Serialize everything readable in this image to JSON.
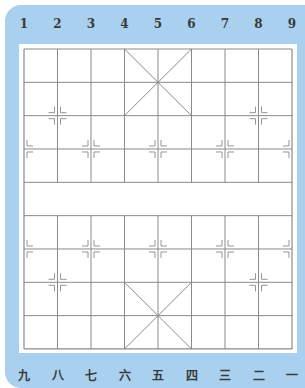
{
  "board": {
    "type": "xiangqi",
    "columns": 9,
    "rows": 10,
    "top_labels": [
      "1",
      "2",
      "3",
      "4",
      "5",
      "6",
      "7",
      "8",
      "9"
    ],
    "bottom_labels": [
      "九",
      "八",
      "七",
      "六",
      "五",
      "四",
      "三",
      "二",
      "一"
    ],
    "markers": [
      {
        "col": 1,
        "row": 2
      },
      {
        "col": 7,
        "row": 2
      },
      {
        "col": 0,
        "row": 3
      },
      {
        "col": 2,
        "row": 3
      },
      {
        "col": 4,
        "row": 3
      },
      {
        "col": 6,
        "row": 3
      },
      {
        "col": 8,
        "row": 3
      },
      {
        "col": 0,
        "row": 6
      },
      {
        "col": 2,
        "row": 6
      },
      {
        "col": 4,
        "row": 6
      },
      {
        "col": 6,
        "row": 6
      },
      {
        "col": 8,
        "row": 6
      },
      {
        "col": 1,
        "row": 7
      },
      {
        "col": 7,
        "row": 7
      }
    ],
    "river_text": ""
  },
  "colors": {
    "panel": "#a9d0ee",
    "board": "#ffffff",
    "lines": "#8a8a8a",
    "labels": "#3a3a3a"
  }
}
